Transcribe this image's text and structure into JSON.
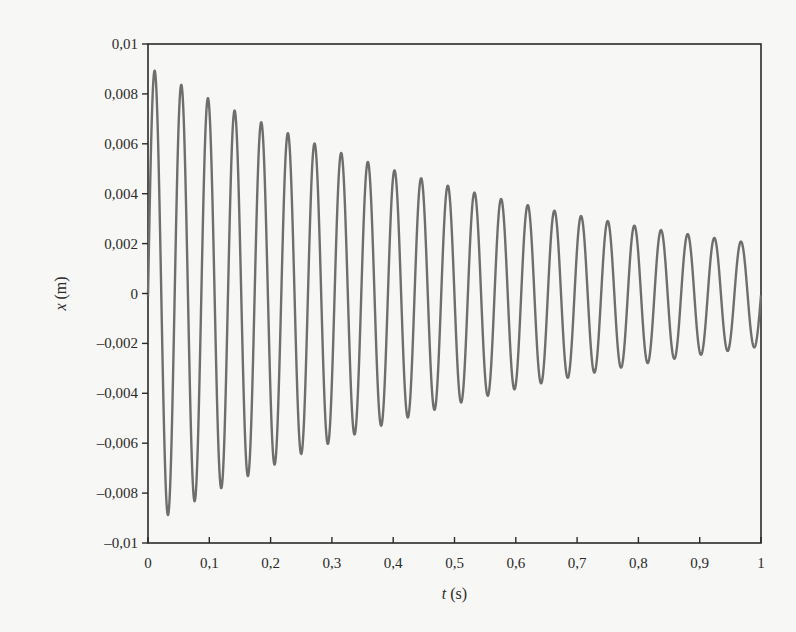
{
  "chart_data": {
    "type": "line",
    "title": "",
    "xlabel": "t (s)",
    "xlabel_var": "t",
    "xlabel_unit": " (s)",
    "ylabel": "x (m)",
    "ylabel_var": "x",
    "ylabel_unit": " (m)",
    "xlim": [
      0,
      1
    ],
    "ylim": [
      -0.01,
      0.01
    ],
    "xticks": [
      0,
      0.1,
      0.2,
      0.3,
      0.4,
      0.5,
      0.6,
      0.7,
      0.8,
      0.9,
      1
    ],
    "xtick_labels": [
      "0",
      "0,1",
      "0,2",
      "0,3",
      "0,4",
      "0,5",
      "0,6",
      "0,7",
      "0,8",
      "0,9",
      "1"
    ],
    "yticks": [
      0.01,
      0.008,
      0.006,
      0.004,
      0.002,
      0,
      -0.002,
      -0.004,
      -0.006,
      -0.008,
      -0.01
    ],
    "ytick_labels": [
      "0,01",
      "0,008",
      "0,006",
      "0,004",
      "0,002",
      "0",
      "–0,002",
      "–0,004",
      "–0,006",
      "–0,008",
      "–0,01"
    ],
    "grid": false,
    "legend": null,
    "series": [
      {
        "name": "x(t)",
        "color": "#6e6e6e",
        "model": "x = A0 * exp(-decay*t) * sin(2*pi*f*t)",
        "A0": 0.0092,
        "decay": 1.5,
        "frequency_hz": 23.0,
        "peaks": [
          {
            "t": 0.011,
            "x": 0.0088
          },
          {
            "t": 0.054,
            "x": 0.0082
          },
          {
            "t": 0.098,
            "x": 0.0076
          },
          {
            "t": 0.141,
            "x": 0.0071
          },
          {
            "t": 0.185,
            "x": 0.0066
          },
          {
            "t": 0.228,
            "x": 0.0062
          },
          {
            "t": 0.272,
            "x": 0.0058
          },
          {
            "t": 0.315,
            "x": 0.0054
          },
          {
            "t": 0.358,
            "x": 0.005
          },
          {
            "t": 0.402,
            "x": 0.0046
          },
          {
            "t": 0.445,
            "x": 0.0044
          },
          {
            "t": 0.489,
            "x": 0.0041
          },
          {
            "t": 0.532,
            "x": 0.0038
          },
          {
            "t": 0.576,
            "x": 0.0036
          },
          {
            "t": 0.619,
            "x": 0.0034
          },
          {
            "t": 0.662,
            "x": 0.0031
          },
          {
            "t": 0.706,
            "x": 0.003
          },
          {
            "t": 0.749,
            "x": 0.0028
          },
          {
            "t": 0.793,
            "x": 0.0026
          },
          {
            "t": 0.836,
            "x": 0.0024
          },
          {
            "t": 0.88,
            "x": 0.0023
          },
          {
            "t": 0.923,
            "x": 0.0022
          },
          {
            "t": 0.966,
            "x": 0.0021
          }
        ],
        "troughs": [
          {
            "t": 0.033,
            "x": -0.0085
          },
          {
            "t": 0.076,
            "x": -0.0079
          },
          {
            "t": 0.12,
            "x": -0.0074
          },
          {
            "t": 0.163,
            "x": -0.0069
          },
          {
            "t": 0.206,
            "x": -0.0064
          },
          {
            "t": 0.25,
            "x": -0.006
          },
          {
            "t": 0.293,
            "x": -0.0056
          },
          {
            "t": 0.337,
            "x": -0.0052
          },
          {
            "t": 0.38,
            "x": -0.0048
          },
          {
            "t": 0.424,
            "x": -0.0045
          },
          {
            "t": 0.467,
            "x": -0.0042
          },
          {
            "t": 0.511,
            "x": -0.0039
          },
          {
            "t": 0.554,
            "x": -0.0036
          },
          {
            "t": 0.597,
            "x": -0.0034
          },
          {
            "t": 0.641,
            "x": -0.0031
          },
          {
            "t": 0.684,
            "x": -0.0029
          },
          {
            "t": 0.728,
            "x": -0.0027
          },
          {
            "t": 0.771,
            "x": -0.0025
          },
          {
            "t": 0.815,
            "x": -0.0024
          },
          {
            "t": 0.858,
            "x": -0.0022
          },
          {
            "t": 0.901,
            "x": -0.002
          },
          {
            "t": 0.945,
            "x": -0.0019
          },
          {
            "t": 0.988,
            "x": -0.0017
          }
        ]
      }
    ]
  },
  "style": {
    "axis_color": "#2a2a2a",
    "line_color": "#6e6e6e",
    "background": "#f7f7f5"
  }
}
